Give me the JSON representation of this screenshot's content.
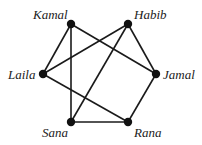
{
  "graph": {
    "nodes": [
      {
        "id": "Kamal",
        "label": "Kamal",
        "x": 71,
        "y": 24,
        "lx": 33,
        "ly": 19
      },
      {
        "id": "Habib",
        "label": "Habib",
        "x": 128,
        "y": 24,
        "lx": 134,
        "ly": 19
      },
      {
        "id": "Laila",
        "label": "Laila",
        "x": 43,
        "y": 74,
        "lx": 8,
        "ly": 79
      },
      {
        "id": "Jamal",
        "label": "Jamal",
        "x": 156,
        "y": 74,
        "lx": 163,
        "ly": 79
      },
      {
        "id": "Sana",
        "label": "Sana",
        "x": 71,
        "y": 122,
        "lx": 42,
        "ly": 137
      },
      {
        "id": "Rana",
        "label": "Rana",
        "x": 128,
        "y": 122,
        "lx": 134,
        "ly": 137
      }
    ],
    "edges": [
      [
        "Kamal",
        "Laila"
      ],
      [
        "Kamal",
        "Sana"
      ],
      [
        "Kamal",
        "Jamal"
      ],
      [
        "Habib",
        "Laila"
      ],
      [
        "Habib",
        "Sana"
      ],
      [
        "Habib",
        "Jamal"
      ],
      [
        "Laila",
        "Rana"
      ],
      [
        "Sana",
        "Rana"
      ],
      [
        "Jamal",
        "Rana"
      ]
    ]
  }
}
